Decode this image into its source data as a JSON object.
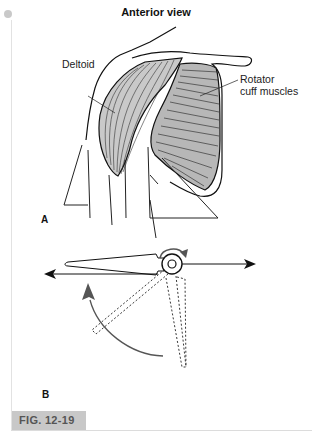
{
  "figure": {
    "title": "Anterior view",
    "labels": {
      "deltoid": "Deltoid",
      "rotator_cuff_line1": "Rotator",
      "rotator_cuff_line2": "cuff muscles"
    },
    "panels": {
      "a": "A",
      "b": "B"
    },
    "caption_tag": "FIG. 12-19"
  },
  "colors": {
    "caption_bg": "#c8c8c8",
    "caption_text": "#555555",
    "rule": "#e2e2e2",
    "arrow_curve": "#555555"
  }
}
